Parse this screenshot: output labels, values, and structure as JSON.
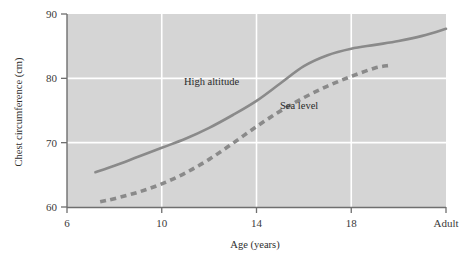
{
  "chart_data": {
    "type": "line",
    "title": "",
    "xlabel": "Age (years)",
    "ylabel": "Chest circumference (cm)",
    "xlim": [
      6,
      22
    ],
    "ylim": [
      60,
      90
    ],
    "grid": true,
    "legend_position": "inline-annotations",
    "x_tick_labels": [
      "6",
      "10",
      "14",
      "18",
      "Adult"
    ],
    "x_tick_values": [
      6,
      10,
      14,
      18,
      22
    ],
    "y_tick_labels": [
      "60",
      "70",
      "80",
      "90"
    ],
    "y_tick_values": [
      60,
      70,
      80,
      90
    ],
    "series": [
      {
        "name": "High altitude",
        "style": "solid",
        "color": "#8a8a8a",
        "x": [
          7.2,
          8,
          9,
          10,
          11,
          12,
          13,
          14,
          15,
          16,
          17,
          18,
          19,
          20,
          21,
          22
        ],
        "values": [
          65.4,
          66.4,
          67.8,
          69.2,
          70.6,
          72.3,
          74.3,
          76.5,
          79.2,
          81.9,
          83.6,
          84.6,
          85.2,
          85.8,
          86.6,
          87.7
        ]
      },
      {
        "name": "Sea level",
        "style": "dashed",
        "color": "#8a8a8a",
        "x": [
          7.4,
          8,
          9,
          10,
          11,
          12,
          13,
          14,
          15,
          16,
          17,
          18,
          19,
          19.6
        ],
        "values": [
          60.8,
          61.3,
          62.3,
          63.6,
          65.3,
          67.4,
          69.9,
          72.5,
          74.9,
          77.0,
          78.8,
          80.3,
          81.6,
          82.0
        ]
      }
    ],
    "annotations": [
      {
        "text": "High altitude",
        "x": 12.1,
        "y": 79.0
      },
      {
        "text": "Sea level",
        "x": 15.8,
        "y": 75.2
      }
    ]
  },
  "colors": {
    "plot_background": "#d5d5d5",
    "gridline": "#ffffff",
    "axis": "#6f6f6f",
    "series_line": "#8a8a8a",
    "text": "#2e2e2e",
    "page_background": "#ffffff"
  }
}
